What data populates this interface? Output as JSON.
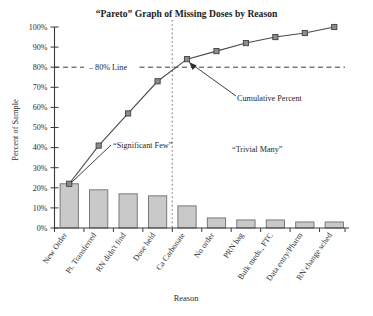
{
  "chart_data": {
    "type": "bar",
    "title": "“Pareto” Graph of Missing Doses by Reason",
    "xlabel": "Reason",
    "ylabel": "Percent of Sample",
    "ylim": [
      0,
      100
    ],
    "ytick_labels": [
      "0%",
      "10%",
      "20%",
      "30%",
      "40%",
      "50%",
      "60%",
      "70%",
      "80%",
      "90%",
      "100%"
    ],
    "ytick_values": [
      0,
      10,
      20,
      30,
      40,
      50,
      60,
      70,
      80,
      90,
      100
    ],
    "grid": false,
    "legend": "none",
    "categories": [
      "New Order",
      "Pt. Transferred",
      "RN didn't find",
      "Dose held",
      "Ca Carbonate",
      "No order",
      "PRN bag",
      "Bulk meds., FTC",
      "Data entry/Pharm",
      "RN change sched"
    ],
    "series": [
      {
        "name": "Percent of Sample",
        "type": "bar",
        "values": [
          22,
          19,
          17,
          16,
          11,
          5,
          4,
          4,
          3,
          3
        ]
      },
      {
        "name": "Cumulative Percent",
        "type": "line",
        "values": [
          22,
          41,
          57,
          73,
          84,
          88,
          92,
          95,
          97,
          100
        ]
      }
    ],
    "reference_lines": [
      {
        "name": "80% Line",
        "orientation": "horizontal",
        "value": 80,
        "label": "– 80% Line"
      },
      {
        "name": "vital-few-divider",
        "orientation": "vertical",
        "between": [
          "Dose held",
          "Ca Carbonate"
        ],
        "label": ""
      }
    ],
    "annotations": [
      {
        "name": "significant-few",
        "text": "“Significant Few”"
      },
      {
        "name": "trivial-many",
        "text": "“Trivial Many”"
      },
      {
        "name": "cumulative-percent-callout",
        "text": "Cumulative Percent"
      }
    ]
  }
}
